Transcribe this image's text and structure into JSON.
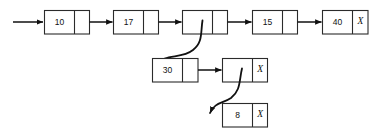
{
  "diagram": {
    "type": "linked-list",
    "null_marker": "X",
    "colors": {
      "background": "#ffffff",
      "stroke": "#2b2b2b",
      "arrow": "#111111",
      "text": "#111111"
    },
    "rows": [
      {
        "id": "main-list",
        "nodes": [
          {
            "id": "node-10",
            "value": "10",
            "pointer": "",
            "next": "node-17"
          },
          {
            "id": "node-17",
            "value": "17",
            "pointer": "",
            "next": "node-empty-1"
          },
          {
            "id": "node-empty-1",
            "value": "",
            "pointer": "",
            "next": "node-15",
            "sublist": "node-30"
          },
          {
            "id": "node-15",
            "value": "15",
            "pointer": "",
            "next": "node-40"
          },
          {
            "id": "node-40",
            "value": "40",
            "pointer": "X",
            "next": null
          }
        ]
      },
      {
        "id": "sublist-1",
        "nodes": [
          {
            "id": "node-30",
            "value": "30",
            "pointer": "",
            "next": "node-empty-2"
          },
          {
            "id": "node-empty-2",
            "value": "",
            "pointer": "X",
            "next": null,
            "sublist": "node-8"
          }
        ]
      },
      {
        "id": "sublist-2",
        "nodes": [
          {
            "id": "node-8",
            "value": "8",
            "pointer": "X",
            "next": null
          }
        ]
      }
    ],
    "head_arrow": {
      "id": "head-arrow",
      "from_x": 13,
      "to_x": 44,
      "y": 22
    },
    "curves": [
      {
        "id": "curve-to-30",
        "from": "node-empty-1",
        "to": "node-30"
      },
      {
        "id": "curve-to-8",
        "from": "node-empty-2",
        "to": "node-8"
      }
    ]
  }
}
